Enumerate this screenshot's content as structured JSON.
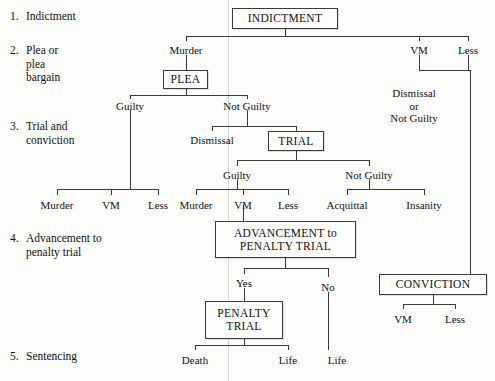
{
  "diagram": {
    "ink": "#3a3a3a",
    "background": "#fdfdfc"
  },
  "stages": [
    {
      "number": "1.",
      "label": "Indictment",
      "x": 10,
      "y": 10,
      "numx": 10,
      "labelx": 26
    },
    {
      "number": "2.",
      "label": "Plea or\nplea\nbargain",
      "x": 10,
      "y": 44,
      "numx": 10,
      "labelx": 26
    },
    {
      "number": "3.",
      "label": "Trial and\nconviction",
      "x": 10,
      "y": 120,
      "numx": 10,
      "labelx": 26
    },
    {
      "number": "4.",
      "label": "Advancement to\npenalty trial",
      "x": 10,
      "y": 232,
      "numx": 10,
      "labelx": 26
    },
    {
      "number": "5.",
      "label": "Sentencing",
      "x": 10,
      "y": 350,
      "numx": 10,
      "labelx": 26
    }
  ],
  "boxes": [
    {
      "name": "indictment-box",
      "text": "INDICTMENT",
      "x": 232,
      "y": 8,
      "w": 106,
      "h": 21
    },
    {
      "name": "plea-box",
      "text": "PLEA",
      "x": 163,
      "y": 70,
      "w": 45,
      "h": 19
    },
    {
      "name": "trial-box",
      "text": "TRIAL",
      "x": 268,
      "y": 131,
      "w": 56,
      "h": 20
    },
    {
      "name": "advancement-box",
      "text": "ADVANCEMENT to\nPENALTY TRIAL",
      "x": 215,
      "y": 221,
      "w": 141,
      "h": 37
    },
    {
      "name": "conviction-box",
      "text": "CONVICTION",
      "x": 379,
      "y": 274,
      "w": 108,
      "h": 21
    },
    {
      "name": "penalty-trial-box",
      "text": "PENALTY\nTRIAL",
      "x": 205,
      "y": 301,
      "w": 78,
      "h": 38
    }
  ],
  "edge_labels": [
    {
      "name": "label-murder-indictment",
      "text": "Murder",
      "x": 186,
      "y": 44
    },
    {
      "name": "label-vm-indictment",
      "text": "VM",
      "x": 419,
      "y": 44
    },
    {
      "name": "label-less-indictment",
      "text": "Less",
      "x": 468,
      "y": 44
    },
    {
      "name": "label-guilty-plea",
      "text": "Guilty",
      "x": 130,
      "y": 100
    },
    {
      "name": "label-not-guilty-plea",
      "text": "Not Guilty",
      "x": 247,
      "y": 100
    },
    {
      "name": "label-dismissal-or-not-guilty",
      "text": "Dismissal\nor\nNot Guilty",
      "x": 414,
      "y": 87
    },
    {
      "name": "label-dismissal-trial",
      "text": "Dismissal",
      "x": 212,
      "y": 134
    },
    {
      "name": "label-guilty-trial",
      "text": "Guilty",
      "x": 237,
      "y": 169
    },
    {
      "name": "label-not-guilty-trial",
      "text": "Not Guilty",
      "x": 369,
      "y": 169
    },
    {
      "name": "label-murder-plea-guilty",
      "text": "Murder",
      "x": 57,
      "y": 199
    },
    {
      "name": "label-vm-plea-guilty",
      "text": "VM",
      "x": 111,
      "y": 199
    },
    {
      "name": "label-less-plea-guilty",
      "text": "Less",
      "x": 158,
      "y": 199
    },
    {
      "name": "label-murder-trial-guilty",
      "text": "Murder",
      "x": 196,
      "y": 199
    },
    {
      "name": "label-vm-trial-guilty",
      "text": "VM",
      "x": 243,
      "y": 199
    },
    {
      "name": "label-less-trial-guilty",
      "text": "Less",
      "x": 288,
      "y": 199
    },
    {
      "name": "label-acquittal",
      "text": "Acquittal",
      "x": 347,
      "y": 199
    },
    {
      "name": "label-insanity",
      "text": "Insanity",
      "x": 424,
      "y": 199
    },
    {
      "name": "label-yes-advancement",
      "text": "Yes",
      "x": 244,
      "y": 277
    },
    {
      "name": "label-no-advancement",
      "text": "No",
      "x": 328,
      "y": 281
    },
    {
      "name": "label-vm-conviction",
      "text": "VM",
      "x": 403,
      "y": 313
    },
    {
      "name": "label-less-conviction",
      "text": "Less",
      "x": 455,
      "y": 313
    },
    {
      "name": "label-death",
      "text": "Death",
      "x": 195,
      "y": 354
    },
    {
      "name": "label-life-penalty",
      "text": "Life",
      "x": 288,
      "y": 354
    },
    {
      "name": "label-life-no",
      "text": "Life",
      "x": 337,
      "y": 354
    }
  ],
  "chart_data": {
    "type": "diagram",
    "nodes": [
      "INDICTMENT",
      "PLEA",
      "TRIAL",
      "ADVANCEMENT to PENALTY TRIAL",
      "CONVICTION",
      "PENALTY TRIAL"
    ],
    "edges": [
      {
        "from": "INDICTMENT",
        "to": "PLEA",
        "label": "Murder"
      },
      {
        "from": "INDICTMENT",
        "to": "Dismissal or Not Guilty",
        "label": "VM"
      },
      {
        "from": "INDICTMENT",
        "to": "CONVICTION",
        "label": "Less"
      },
      {
        "from": "PLEA",
        "to": "Murder / VM / Less",
        "label": "Guilty"
      },
      {
        "from": "PLEA",
        "to": "Dismissal",
        "label": "Not Guilty"
      },
      {
        "from": "PLEA",
        "to": "TRIAL",
        "label": "Not Guilty"
      },
      {
        "from": "TRIAL",
        "to": "Murder / VM / Less",
        "label": "Guilty"
      },
      {
        "from": "TRIAL",
        "to": "Acquittal / Insanity",
        "label": "Not Guilty"
      },
      {
        "from": "TRIAL-Guilty-VM",
        "to": "ADVANCEMENT to PENALTY TRIAL",
        "label": ""
      },
      {
        "from": "ADVANCEMENT to PENALTY TRIAL",
        "to": "PENALTY TRIAL",
        "label": "Yes"
      },
      {
        "from": "ADVANCEMENT to PENALTY TRIAL",
        "to": "Life",
        "label": "No"
      },
      {
        "from": "CONVICTION",
        "to": "VM / Less",
        "label": ""
      },
      {
        "from": "PENALTY TRIAL",
        "to": "Death",
        "label": ""
      },
      {
        "from": "PENALTY TRIAL",
        "to": "Life",
        "label": ""
      }
    ],
    "stages": [
      "Indictment",
      "Plea or plea bargain",
      "Trial and conviction",
      "Advancement to penalty trial",
      "Sentencing"
    ]
  }
}
